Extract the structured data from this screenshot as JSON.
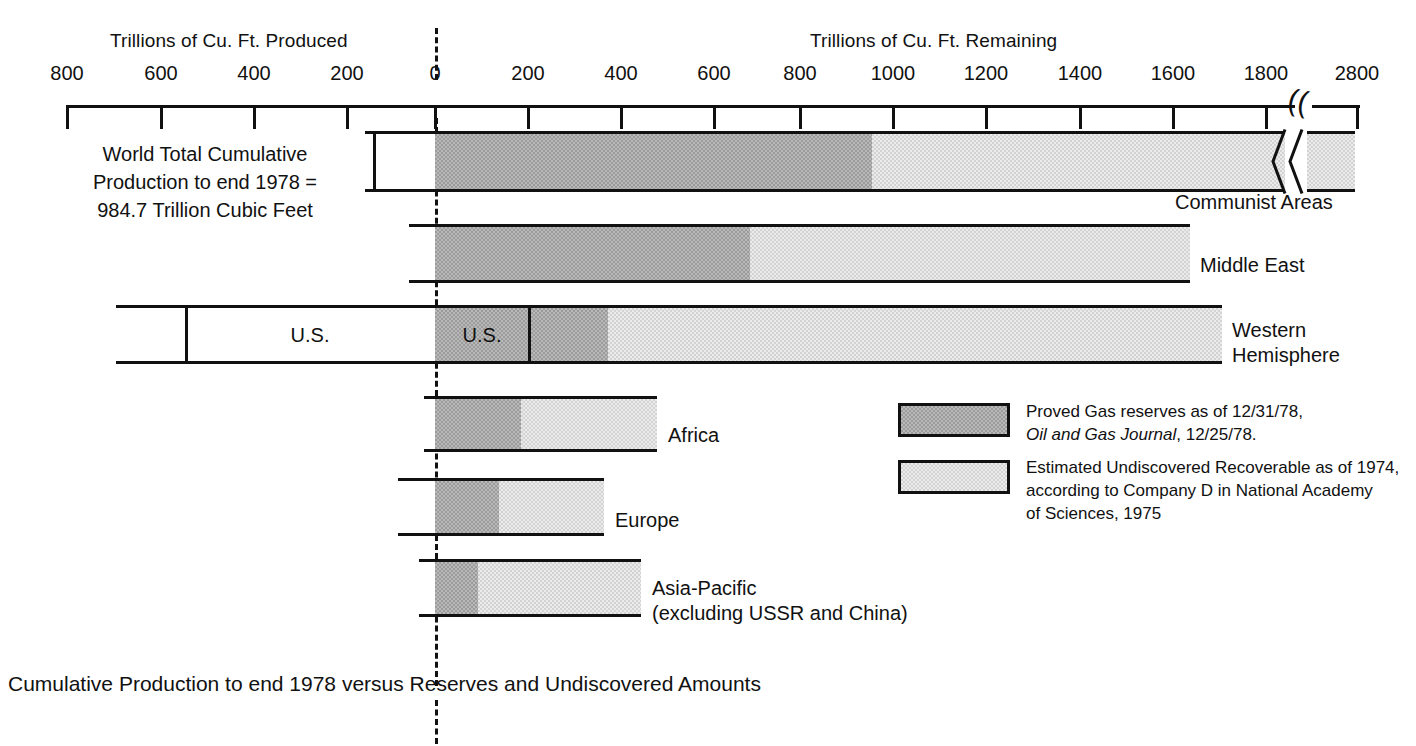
{
  "axis": {
    "left_title": "Trillions of Cu. Ft. Produced",
    "right_title": "Trillions of Cu. Ft. Remaining",
    "ticks": [
      {
        "label": "800",
        "x": 67
      },
      {
        "label": "600",
        "x": 161
      },
      {
        "label": "400",
        "x": 254
      },
      {
        "label": "200",
        "x": 347
      },
      {
        "label": "0",
        "x": 435
      },
      {
        "label": "200",
        "x": 528
      },
      {
        "label": "400",
        "x": 621
      },
      {
        "label": "600",
        "x": 714
      },
      {
        "label": "800",
        "x": 800
      },
      {
        "label": "1000",
        "x": 893
      },
      {
        "label": "1200",
        "x": 986
      },
      {
        "label": "1400",
        "x": 1080
      },
      {
        "label": "1600",
        "x": 1173
      },
      {
        "label": "1800",
        "x": 1266
      },
      {
        "label": "2800",
        "x": 1357
      }
    ],
    "break_marker": "(("
  },
  "world_caption": [
    "World Total Cumulative",
    "Production to end 1978 =",
    "984.7 Trillion Cubic Feet"
  ],
  "chart_data": {
    "type": "bar",
    "title": "Cumulative Production to end 1978 versus Reserves and Undiscovered Amounts",
    "xlabel_left": "Trillions of Cu. Ft. Produced",
    "xlabel_right": "Trillions of Cu. Ft. Remaining",
    "orientation": "horizontal-diverging",
    "zero_value": 0,
    "xlim": [
      -880,
      2800
    ],
    "axis_break_between": [
      1850,
      2750
    ],
    "grid": false,
    "legend_position": "center-right",
    "series": [
      {
        "name": "Cumulative Production to end 1978",
        "fill": "white"
      },
      {
        "name": "Proved Gas reserves as of 12/31/78",
        "fill": "dark-gray"
      },
      {
        "name": "Estimated Undiscovered Recoverable as of 1974",
        "fill": "light-gray"
      }
    ],
    "categories": [
      {
        "label": "Communist Areas",
        "label_lines": [
          "Communist Areas"
        ],
        "produced": 150,
        "produced_sub": [
          {
            "label": "",
            "value": 18
          },
          {
            "label": "",
            "value": 132
          }
        ],
        "proved": 945,
        "undiscovered": 1855,
        "has_axis_break": true
      },
      {
        "label": "Middle East",
        "label_lines": [
          "Middle East"
        ],
        "produced": 55,
        "proved": 725,
        "undiscovered": 1630
      },
      {
        "label": "Western Hemisphere",
        "label_lines": [
          "Western",
          "Hemisphere"
        ],
        "produced": 685,
        "produced_us": 535,
        "produced_in_bar_label": "U.S.",
        "proved": 370,
        "proved_us": 200,
        "proved_in_bar_label": "U.S.",
        "undiscovered": 1690
      },
      {
        "label": "Africa",
        "label_lines": [
          "Africa"
        ],
        "produced": 22,
        "proved": 185,
        "undiscovered": 480
      },
      {
        "label": "Europe",
        "label_lines": [
          "Europe"
        ],
        "produced": 78,
        "proved": 138,
        "undiscovered": 363
      },
      {
        "label": "Asia-Pacific (excluding USSR and China)",
        "label_lines": [
          "Asia-Pacific",
          "(excluding USSR and China)"
        ],
        "produced": 35,
        "proved": 103,
        "undiscovered": 453
      }
    ]
  },
  "bars": [
    {
      "name": "communist-areas",
      "label_lines": [
        "Communist Areas"
      ],
      "label_x": 1175,
      "label_y": 190,
      "y": 131,
      "h": 61,
      "left": 365,
      "right": 1285,
      "inner_divider_x": 373,
      "white_to": 435,
      "dark_to": 872,
      "light_to": 1285,
      "tail": {
        "left": 1303,
        "right": 1355
      }
    },
    {
      "name": "middle-east",
      "label_lines": [
        "Middle East"
      ],
      "label_x": 1200,
      "label_y": 253,
      "y": 224,
      "h": 59,
      "left": 409,
      "right": 1190,
      "white_to": 435,
      "dark_to": 750,
      "light_to": 1190
    },
    {
      "name": "western-hemisphere",
      "label_lines": [
        "Western",
        "Hemisphere"
      ],
      "label_x": 1232,
      "label_y": 318,
      "y": 305,
      "h": 59,
      "left": 116,
      "right": 1222,
      "inner_divider_x": 185,
      "white_to": 435,
      "dark_to": 608,
      "light_to": 1222,
      "us_divider_x": 528,
      "in_bar_labels": [
        {
          "text": "U.S.",
          "x": 310
        },
        {
          "text": "U.S.",
          "x": 482
        }
      ]
    },
    {
      "name": "africa",
      "label_lines": [
        "Africa"
      ],
      "label_x": 668,
      "label_y": 423,
      "y": 396,
      "h": 56,
      "left": 424,
      "right": 657,
      "white_to": 435,
      "dark_to": 521,
      "light_to": 657
    },
    {
      "name": "europe",
      "label_lines": [
        "Europe"
      ],
      "label_x": 615,
      "label_y": 508,
      "y": 478,
      "h": 58,
      "left": 398,
      "right": 604,
      "white_to": 435,
      "dark_to": 499,
      "light_to": 604
    },
    {
      "name": "asia-pacific",
      "label_lines": [
        "Asia-Pacific",
        "(excluding USSR and China)"
      ],
      "label_x": 652,
      "label_y": 576,
      "y": 559,
      "h": 58,
      "left": 419,
      "right": 641,
      "white_to": 435,
      "dark_to": 478,
      "light_to": 641
    }
  ],
  "legend": {
    "items": [
      {
        "swatch": "dark",
        "lines": [
          {
            "text": "Proved Gas reserves as of 12/31/78,",
            "italic_part": ""
          },
          {
            "text": "Oil and Gas Journal, 12/25/78.",
            "italic_prefix": "Oil and Gas Journal",
            "rest": ", 12/25/78."
          }
        ]
      },
      {
        "swatch": "light",
        "lines": [
          {
            "text": "Estimated Undiscovered Recoverable as of 1974,"
          },
          {
            "text": "according to Company D in  National Academy"
          },
          {
            "text": "of Sciences, 1975"
          }
        ]
      }
    ]
  },
  "footer": {
    "caption": "Cumulative Production to end 1978 versus Reserves and Undiscovered Amounts"
  }
}
